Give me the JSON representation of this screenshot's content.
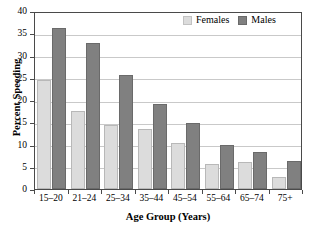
{
  "chart_data": {
    "type": "bar",
    "title": "",
    "xlabel": "Age Group (Years)",
    "ylabel": "Percent Speeding",
    "categories": [
      "15–20",
      "21–24",
      "25–34",
      "35–44",
      "45–54",
      "55–64",
      "65–74",
      "75+"
    ],
    "series": [
      {
        "name": "Females",
        "color": "#dcdcdc",
        "values": [
          24.5,
          17.6,
          14.3,
          13.5,
          10.4,
          5.7,
          6.0,
          2.7
        ]
      },
      {
        "name": "Males",
        "color": "#808080",
        "values": [
          36.2,
          32.8,
          25.7,
          19.1,
          14.8,
          9.9,
          8.4,
          6.4
        ]
      }
    ],
    "ylim": [
      0,
      40
    ],
    "yticks": [
      0,
      5,
      10,
      15,
      20,
      25,
      30,
      35,
      40
    ],
    "ytick_labels": [
      "0",
      "5",
      "10",
      "15",
      "20",
      "25",
      "30",
      "35",
      "40"
    ],
    "grid": true,
    "grid_axis": "y",
    "legend_position": "top-right",
    "legend_entries": [
      "Females",
      "Males"
    ]
  }
}
